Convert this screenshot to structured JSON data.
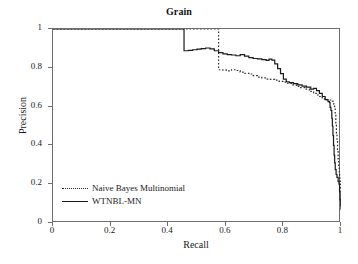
{
  "chart_data": {
    "type": "line",
    "title": "Grain",
    "xlabel": "Recall",
    "ylabel": "Precision",
    "xlim": [
      0,
      1
    ],
    "ylim": [
      0,
      1
    ],
    "grid": false,
    "legend_position": "lower-left-inside",
    "xticks": [
      "0",
      "0.2",
      "0.4",
      "0.6",
      "0.8",
      "1"
    ],
    "xtick_values": [
      0,
      0.2,
      0.4,
      0.6,
      0.8,
      1
    ],
    "yticks": [
      "0",
      "0.2",
      "0.4",
      "0.6",
      "0.8",
      "1"
    ],
    "ytick_values": [
      0,
      0.2,
      0.4,
      0.6,
      0.8,
      1
    ],
    "series": [
      {
        "name": "Naive Bayes Multinomial",
        "style": "dotted",
        "color": "#2b2b2b",
        "points": [
          [
            0.0,
            1.0
          ],
          [
            0.1,
            1.0
          ],
          [
            0.2,
            1.0
          ],
          [
            0.3,
            1.0
          ],
          [
            0.4,
            1.0
          ],
          [
            0.5,
            1.0
          ],
          [
            0.56,
            1.0
          ],
          [
            0.575,
            1.0
          ],
          [
            0.575,
            0.79
          ],
          [
            0.59,
            0.788
          ],
          [
            0.605,
            0.784
          ],
          [
            0.62,
            0.79
          ],
          [
            0.635,
            0.786
          ],
          [
            0.65,
            0.778
          ],
          [
            0.665,
            0.772
          ],
          [
            0.68,
            0.768
          ],
          [
            0.695,
            0.76
          ],
          [
            0.71,
            0.752
          ],
          [
            0.725,
            0.748
          ],
          [
            0.74,
            0.742
          ],
          [
            0.755,
            0.74
          ],
          [
            0.77,
            0.736
          ],
          [
            0.785,
            0.73
          ],
          [
            0.8,
            0.726
          ],
          [
            0.815,
            0.72
          ],
          [
            0.83,
            0.712
          ],
          [
            0.845,
            0.704
          ],
          [
            0.86,
            0.698
          ],
          [
            0.875,
            0.69
          ],
          [
            0.89,
            0.678
          ],
          [
            0.905,
            0.668
          ],
          [
            0.92,
            0.652
          ],
          [
            0.935,
            0.64
          ],
          [
            0.95,
            0.636
          ],
          [
            0.96,
            0.634
          ],
          [
            0.97,
            0.628
          ],
          [
            0.975,
            0.612
          ],
          [
            0.978,
            0.6
          ],
          [
            0.98,
            0.56
          ],
          [
            0.982,
            0.51
          ],
          [
            0.984,
            0.46
          ],
          [
            0.986,
            0.42
          ],
          [
            0.988,
            0.38
          ],
          [
            0.99,
            0.33
          ],
          [
            0.992,
            0.29
          ],
          [
            0.994,
            0.26
          ],
          [
            0.995,
            0.24
          ],
          [
            0.996,
            0.225
          ],
          [
            0.997,
            0.215
          ],
          [
            0.998,
            0.2
          ],
          [
            0.999,
            0.18
          ],
          [
            1.0,
            0.155
          ]
        ]
      },
      {
        "name": "WTNBL-MN",
        "style": "solid",
        "color": "#1a1a1a",
        "points": [
          [
            0.0,
            1.0
          ],
          [
            0.1,
            1.0
          ],
          [
            0.2,
            1.0
          ],
          [
            0.3,
            1.0
          ],
          [
            0.4,
            1.0
          ],
          [
            0.45,
            1.0
          ],
          [
            0.455,
            1.0
          ],
          [
            0.455,
            0.888
          ],
          [
            0.47,
            0.89
          ],
          [
            0.485,
            0.893
          ],
          [
            0.5,
            0.896
          ],
          [
            0.515,
            0.899
          ],
          [
            0.53,
            0.902
          ],
          [
            0.545,
            0.898
          ],
          [
            0.56,
            0.888
          ],
          [
            0.575,
            0.878
          ],
          [
            0.59,
            0.872
          ],
          [
            0.605,
            0.868
          ],
          [
            0.62,
            0.866
          ],
          [
            0.635,
            0.862
          ],
          [
            0.65,
            0.868
          ],
          [
            0.665,
            0.86
          ],
          [
            0.68,
            0.852
          ],
          [
            0.695,
            0.848
          ],
          [
            0.71,
            0.846
          ],
          [
            0.725,
            0.842
          ],
          [
            0.74,
            0.838
          ],
          [
            0.75,
            0.845
          ],
          [
            0.76,
            0.84
          ],
          [
            0.77,
            0.82
          ],
          [
            0.78,
            0.796
          ],
          [
            0.79,
            0.77
          ],
          [
            0.8,
            0.742
          ],
          [
            0.81,
            0.728
          ],
          [
            0.82,
            0.724
          ],
          [
            0.835,
            0.718
          ],
          [
            0.85,
            0.712
          ],
          [
            0.865,
            0.706
          ],
          [
            0.88,
            0.7
          ],
          [
            0.895,
            0.69
          ],
          [
            0.905,
            0.694
          ],
          [
            0.915,
            0.682
          ],
          [
            0.925,
            0.668
          ],
          [
            0.935,
            0.652
          ],
          [
            0.945,
            0.636
          ],
          [
            0.955,
            0.626
          ],
          [
            0.96,
            0.62
          ],
          [
            0.962,
            0.596
          ],
          [
            0.965,
            0.58
          ],
          [
            0.968,
            0.54
          ],
          [
            0.97,
            0.5
          ],
          [
            0.972,
            0.45
          ],
          [
            0.974,
            0.4
          ],
          [
            0.976,
            0.35
          ],
          [
            0.978,
            0.31
          ],
          [
            0.98,
            0.275
          ],
          [
            0.983,
            0.25
          ],
          [
            0.986,
            0.235
          ],
          [
            0.99,
            0.215
          ],
          [
            0.993,
            0.2
          ],
          [
            0.995,
            0.16
          ],
          [
            0.997,
            0.12
          ],
          [
            0.999,
            0.09
          ],
          [
            1.0,
            0.068
          ]
        ]
      }
    ]
  }
}
